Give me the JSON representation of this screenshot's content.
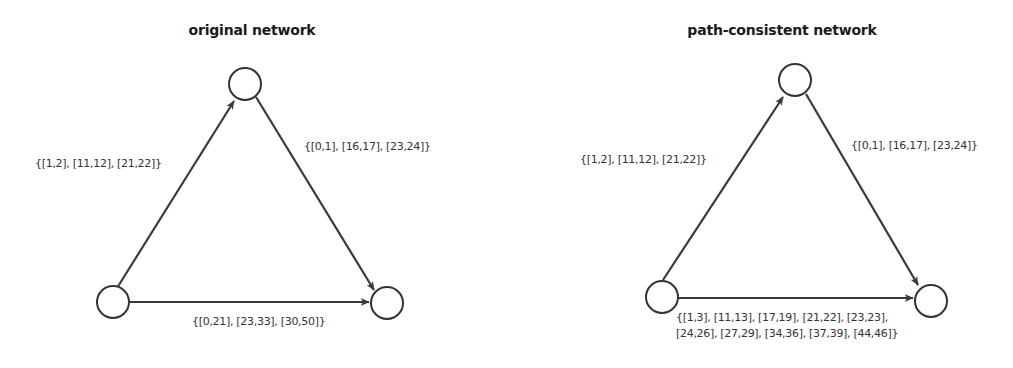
{
  "diagrams": [
    {
      "title": "original network",
      "edges": {
        "top_left": "{[1,2], [11,12], [21,22]}",
        "top_right": "{[0,1], [16,17], [23,24]}",
        "bottom": "{[0,21], [23,33], [30,50]}"
      }
    },
    {
      "title": "path-consistent network",
      "edges": {
        "top_left": "{[1,2], [11,12], [21,22]}",
        "top_right": "{[0,1], [16,17], [23,24]}",
        "bottom_line1": "{[1,3], [11,13], [17,19], [21,22], [23,23],",
        "bottom_line2": "[24,26], [27,29], [34,36], [37,39], [44,46]}"
      }
    }
  ],
  "colors": {
    "stroke": "#333333",
    "text": "#333333",
    "background": "#ffffff"
  }
}
